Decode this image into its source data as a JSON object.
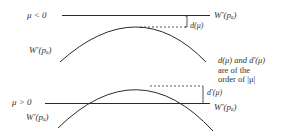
{
  "top_panel": {
    "condition_label": "μ < 0",
    "line_label": "W'(pₐ)",
    "curve_label": "W'(pₐ)",
    "gap_label": "d(μ)"
  },
  "bottom_panel": {
    "condition_label": "μ > 0",
    "line_label": "W'(pₐ)",
    "curve_label": "W'(pₐ)",
    "gap_label": "d'(μ)"
  },
  "note": {
    "line1": "d(μ) and d'(μ)",
    "line2": "are of the",
    "line3": "order of |μ|"
  },
  "colors": {
    "ink": "#2a2a2a",
    "background": "#ffffff"
  }
}
